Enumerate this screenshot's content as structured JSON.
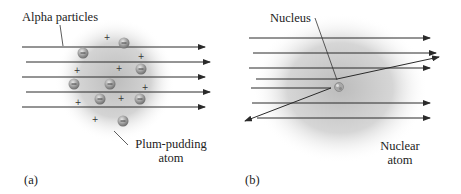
{
  "panel_a": {
    "caption": "(a)",
    "label_alpha": "Alpha particles",
    "label_atom_line1": "Plum-pudding",
    "label_atom_line2": "atom",
    "electron_symbol": "−",
    "proton_symbol": "+"
  },
  "panel_b": {
    "caption": "(b)",
    "label_nucleus": "Nucleus",
    "label_atom_line1": "Nuclear",
    "label_atom_line2": "atom"
  },
  "colors": {
    "line": "#2a2a2a",
    "cloud": "#b8b8b8",
    "electron": "#9a9a9a",
    "text": "#222222"
  }
}
